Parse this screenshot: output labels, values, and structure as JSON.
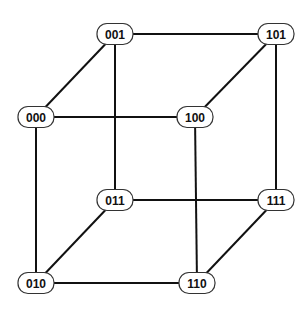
{
  "diagram": {
    "type": "hypercube-graph",
    "stroke_color": "#111111",
    "node_fill": "#ffffff",
    "nodes": [
      {
        "id": "001",
        "label": "001",
        "x": 115,
        "y": 34
      },
      {
        "id": "101",
        "label": "101",
        "x": 276,
        "y": 34
      },
      {
        "id": "000",
        "label": "000",
        "x": 36,
        "y": 117
      },
      {
        "id": "100",
        "label": "100",
        "x": 195,
        "y": 117
      },
      {
        "id": "011",
        "label": "011",
        "x": 115,
        "y": 200
      },
      {
        "id": "111",
        "label": "111",
        "x": 276,
        "y": 200
      },
      {
        "id": "010",
        "label": "010",
        "x": 36,
        "y": 283
      },
      {
        "id": "110",
        "label": "110",
        "x": 197,
        "y": 283
      }
    ],
    "edges": [
      [
        "001",
        "101"
      ],
      [
        "000",
        "100"
      ],
      [
        "011",
        "111"
      ],
      [
        "010",
        "110"
      ],
      [
        "000",
        "001"
      ],
      [
        "100",
        "101"
      ],
      [
        "010",
        "011"
      ],
      [
        "110",
        "111"
      ],
      [
        "000",
        "010"
      ],
      [
        "001",
        "011"
      ],
      [
        "100",
        "110"
      ],
      [
        "101",
        "111"
      ]
    ]
  }
}
